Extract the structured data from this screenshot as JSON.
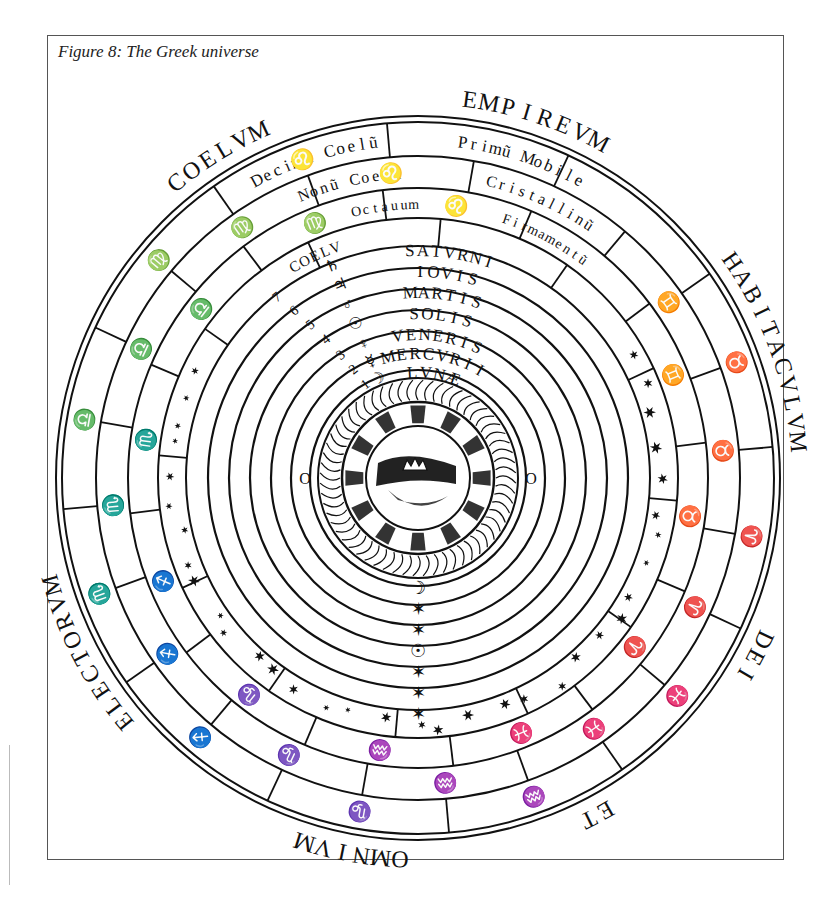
{
  "figure": {
    "caption": "Figure 8: The Greek universe"
  },
  "outer_inscription": [
    {
      "id": "coelum",
      "text": "COELVM",
      "angle_deg": -122
    },
    {
      "id": "empireum",
      "text": "EMPIREVM",
      "angle_deg": -72
    },
    {
      "id": "habitaculum",
      "text": "HABITACVLVM",
      "angle_deg": -20
    },
    {
      "id": "dei",
      "text": "DEI",
      "angle_deg": 28
    },
    {
      "id": "et",
      "text": "ET",
      "angle_deg": 62
    },
    {
      "id": "omnium",
      "text": "OMNIVM",
      "angle_deg": 100
    },
    {
      "id": "electorum",
      "text": "ELECTORVM",
      "angle_deg": 152
    }
  ],
  "outer_heavens": [
    {
      "id": "decimum-coelum",
      "text": "Decimũ Coelũ",
      "ring": "tenth"
    },
    {
      "id": "primum-mobile",
      "text": "Primũ Mobile",
      "ring": "tenth"
    },
    {
      "id": "nonum-coelum",
      "text": "Nonũ Coelũ",
      "ring": "ninth"
    },
    {
      "id": "crystallinum",
      "text": "Cristallinũ",
      "ring": "ninth"
    },
    {
      "id": "octavum",
      "text": "Octauum",
      "ring": "eighth"
    },
    {
      "id": "firmamentum",
      "text": "Firmamentũ",
      "ring": "eighth"
    },
    {
      "id": "coelum-label",
      "text": "COELV",
      "ring": "eighth"
    }
  ],
  "planetary_spheres": [
    {
      "id": "saturni",
      "text": "SATVRNI",
      "symbol": "♄",
      "number": "7"
    },
    {
      "id": "iovis",
      "text": "IOVIS",
      "symbol": "♃",
      "number": "6"
    },
    {
      "id": "martis",
      "text": "MARTIS",
      "symbol": "♂",
      "number": "5"
    },
    {
      "id": "solis",
      "text": "SOLIS",
      "symbol": "☉",
      "number": "4"
    },
    {
      "id": "veneris",
      "text": "VENERIS",
      "symbol": "♀",
      "number": "3"
    },
    {
      "id": "mercurii",
      "text": "MERCVRII",
      "symbol": "☿",
      "number": "2"
    },
    {
      "id": "lunae",
      "text": "LVNÆ",
      "symbol": "☽",
      "number": "1"
    }
  ],
  "sphere_numbers": [
    "9",
    "8",
    "7",
    "6",
    "5",
    "4",
    "3",
    "2",
    "1"
  ],
  "zodiac": {
    "outer_ring": [
      "♋",
      "♊",
      "♉",
      "♈",
      "♓",
      "♒",
      "♑",
      "♐",
      "♏",
      "♎",
      "♍",
      "♌"
    ],
    "middle_ring": [
      "♋",
      "♊",
      "♉",
      "♈",
      "♓",
      "♒",
      "♑",
      "♐",
      "♏",
      "♎",
      "♍",
      "♌"
    ],
    "inner_ring": [
      "♋",
      "♊",
      "♉",
      "♈",
      "♓",
      "♒",
      "♑",
      "♐",
      "♏",
      "♎",
      "♍",
      "♌"
    ]
  },
  "center": {
    "elements": [
      "fire",
      "air",
      "water",
      "earth"
    ],
    "earth_marker": "O"
  },
  "vertical_markers": [
    "☽",
    "✶",
    "✶",
    "☉",
    "✶",
    "✶",
    "✶"
  ],
  "colors": {
    "ink": "#111111",
    "paper": "#ffffff",
    "frame": "#555555"
  }
}
